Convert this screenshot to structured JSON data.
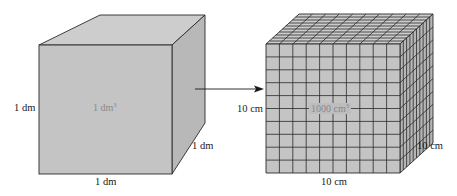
{
  "diagram": {
    "left_cube": {
      "height_label": "1 dm",
      "depth_label": "1 dm",
      "width_label": "1 dm",
      "volume_label": "1 dm",
      "volume_exponent": "3"
    },
    "arrow": {
      "direction": "right"
    },
    "right_cube": {
      "height_label": "10 cm",
      "depth_label": "10 cm",
      "width_label": "10 cm",
      "volume_label": "1000 cm",
      "volume_exponent": "3",
      "grid_divisions": 10
    },
    "colors": {
      "face_front": "#c4c4c4",
      "face_top": "#cdcdcd",
      "face_side": "#b6b6b6",
      "edge": "#2a2a2a"
    }
  }
}
